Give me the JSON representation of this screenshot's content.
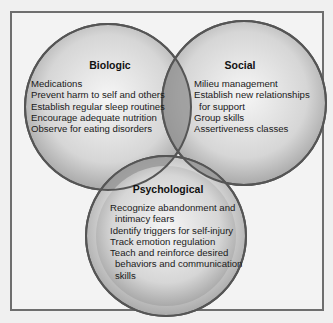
{
  "diagram": {
    "type": "venn",
    "circles": [
      {
        "id": "biologic",
        "title": "Biologic",
        "items": [
          "Medications",
          "Prevent harm to self and others",
          "Establish regular sleep routines",
          "Encourage adequate nutrition",
          "Observe for eating disorders"
        ]
      },
      {
        "id": "social",
        "title": "Social",
        "items": [
          "Milieu management",
          "Establish new relationships",
          "for support",
          "Group skills",
          "Assertiveness classes"
        ]
      },
      {
        "id": "psychological",
        "title": "Psychological",
        "items": [
          "Recognize abandonment and",
          "intimacy fears",
          "Identify triggers for self-injury",
          "Track emotion regulation",
          "Teach and reinforce desired",
          "behaviors and communication",
          "skills"
        ]
      }
    ],
    "colors": {
      "frame_border": "#6e6e6e",
      "circle_outline": "#555555",
      "overlap": "#8a8a8a"
    }
  }
}
